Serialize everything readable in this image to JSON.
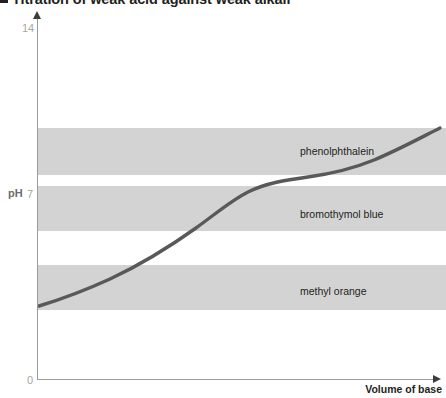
{
  "title": {
    "bullet": "square-bullet",
    "text": "Titration of weak acid against weak alkali"
  },
  "axes": {
    "y_label": "pH",
    "y_top_tick": "14",
    "y_mid_tick": "7",
    "y_bottom_tick": "0",
    "x_label": "Volume of base",
    "y_arrow_icon": "arrow-up-icon",
    "x_arrow_icon": "arrow-right-icon"
  },
  "bands": [
    {
      "label": "phenolphthalein",
      "top": 128,
      "height": 47,
      "label_x": 300,
      "label_y": 145,
      "color": "#d3d3d3"
    },
    {
      "label": "bromothymol blue",
      "top": 186,
      "height": 45,
      "label_x": 300,
      "label_y": 208,
      "color": "#d3d3d3"
    },
    {
      "label": "methyl orange",
      "top": 265,
      "height": 45,
      "label_x": 300,
      "label_y": 285,
      "color": "#d3d3d3"
    }
  ],
  "chart_data": {
    "type": "line",
    "title": "Titration of weak acid against weak alkali",
    "xlabel": "Volume of base",
    "ylabel": "pH",
    "ylim": [
      0,
      14
    ],
    "yticks": [
      0,
      7,
      14
    ],
    "grid": false,
    "legend": "none",
    "curve_color": "#58595b",
    "curve_width": 3.4,
    "annotations": [
      "phenolphthalein",
      "bromothymol blue",
      "methyl orange"
    ],
    "indicator_ranges": [
      {
        "name": "phenolphthalein",
        "pH_low": 8.3,
        "pH_high": 10.0
      },
      {
        "name": "bromothymol blue",
        "pH_low": 6.0,
        "pH_high": 7.6
      },
      {
        "name": "methyl orange",
        "pH_low": 3.1,
        "pH_high": 4.4
      }
    ],
    "series": [
      {
        "name": "weak acid vs weak alkali titration curve",
        "x": [
          0,
          5,
          10,
          15,
          20,
          25,
          30,
          35,
          40,
          45,
          50,
          55,
          60,
          65,
          70,
          75,
          80,
          85,
          90,
          95,
          100
        ],
        "y": [
          2.9,
          3.2,
          3.5,
          3.8,
          4.0,
          4.3,
          4.6,
          4.9,
          5.2,
          5.6,
          6.2,
          7.0,
          7.6,
          7.9,
          8.1,
          8.3,
          8.5,
          8.7,
          9.0,
          9.4,
          9.8
        ]
      }
    ]
  },
  "curve_path": "M 39,306 C 62,299 86,290 110,279 C 140,265 168,248 196,228 C 218,212 232,200 248,192 C 266,183 286,180 308,177 C 330,174 352,169 374,160 C 398,150 420,138 440,128"
}
